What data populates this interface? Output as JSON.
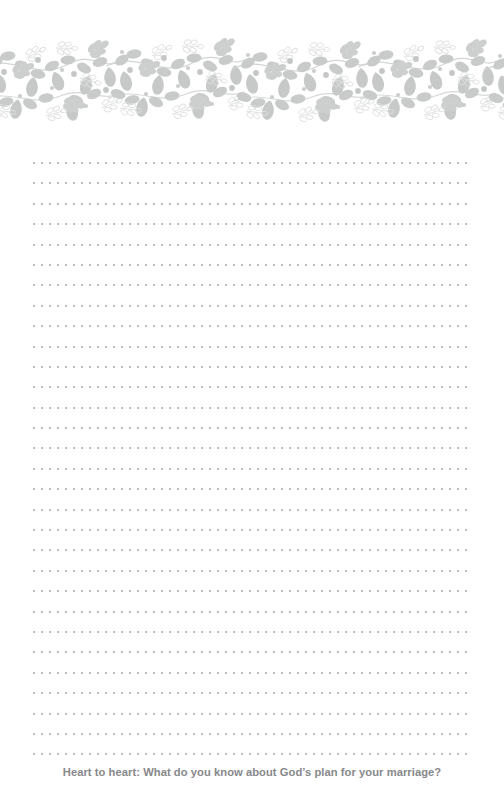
{
  "page": {
    "background_color": "#ffffff",
    "width": 504,
    "height": 810,
    "kind": "journal-writing-page"
  },
  "banner": {
    "name": "botanical-leaf-border",
    "description": "Decorative horizontal band of gray leaves, berries, teardrop petals and outlined sprigs on vines",
    "fill_color": "#c9cbcb",
    "outline_color": "#dedfdf",
    "accent_color": "#b9bbbb",
    "vine_color": "#cfd1d1"
  },
  "writing_area": {
    "name": "dotted-ruled-lines",
    "line_count": 30,
    "line_color": "#bcbcbc",
    "dot_pitch_px": 8,
    "line_spacing_px": 20.4,
    "left_px": 33,
    "right_px": 473
  },
  "footer": {
    "prompt": "Heart to heart: What do you know about God’s plan for your marriage?",
    "color": "#87888a"
  }
}
